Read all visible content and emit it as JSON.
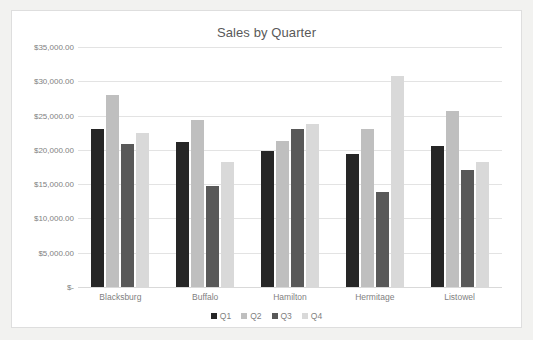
{
  "chart_data": {
    "type": "bar",
    "title": "Sales by Quarter",
    "xlabel": "",
    "ylabel": "",
    "ylim": [
      0,
      35000
    ],
    "grid": true,
    "legend_position": "bottom",
    "categories": [
      "Blacksburg",
      "Buffalo",
      "Hamilton",
      "Hermitage",
      "Listowel"
    ],
    "ytick_labels": [
      "$35,000.00",
      "$30,000.00",
      "$25,000.00",
      "$20,000.00",
      "$15,000.00",
      "$10,000.00",
      "$5,000.00",
      "$-"
    ],
    "ytick_values": [
      35000,
      30000,
      25000,
      20000,
      15000,
      10000,
      5000,
      0
    ],
    "series": [
      {
        "name": "Q1",
        "color": "#262626",
        "values": [
          23000,
          21200,
          19800,
          19400,
          20500
        ]
      },
      {
        "name": "Q2",
        "color": "#bfbfbf",
        "values": [
          28000,
          24400,
          21300,
          23100,
          25700
        ]
      },
      {
        "name": "Q3",
        "color": "#595959",
        "values": [
          20800,
          14800,
          23000,
          13900,
          17000
        ]
      },
      {
        "name": "Q4",
        "color": "#d9d9d9",
        "values": [
          22400,
          18200,
          23800,
          30800,
          18300
        ]
      }
    ]
  },
  "colors": {
    "chart_background": "#ffffff",
    "page_background": "#f2f2f0",
    "border": "#dedede",
    "gridline": "#e3e3e3",
    "text": "#7f7f7f",
    "title_text": "#595959"
  }
}
